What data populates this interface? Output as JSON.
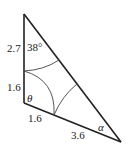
{
  "diagram": {
    "type": "triangle-with-arcs",
    "stroke_color": "#222222",
    "vertices": {
      "top": [
        24,
        14
      ],
      "bottom_left": [
        24,
        103
      ],
      "right": [
        121,
        142
      ]
    },
    "labels": {
      "left_upper_side": "2.7",
      "left_lower_side": "1.6",
      "top_angle": "38°",
      "bottom_left_angle": "θ",
      "bottom_side_near": "1.6",
      "bottom_side_far": "3.6",
      "right_angle": "α"
    }
  }
}
